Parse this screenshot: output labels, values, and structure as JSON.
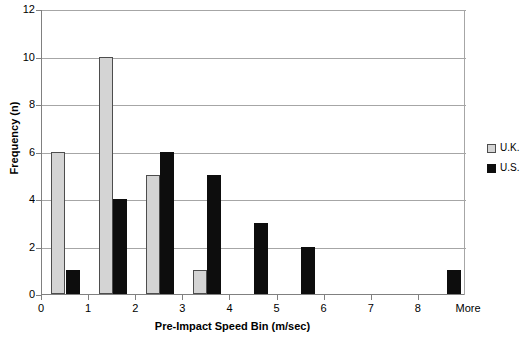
{
  "chart_data": {
    "type": "bar",
    "title": "",
    "xlabel": "Pre-Impact Speed Bin (m/sec)",
    "ylabel": "Frequency (n)",
    "ylim": [
      0,
      12
    ],
    "ytick_values": [
      0,
      2,
      4,
      6,
      8,
      10,
      12
    ],
    "ytick_labels": [
      "0",
      "2",
      "4",
      "6",
      "8",
      "10",
      "12"
    ],
    "xlim": [
      0,
      9
    ],
    "xtick_values": [
      0,
      1,
      2,
      3,
      4,
      5,
      6,
      7,
      8,
      9
    ],
    "xtick_labels": [
      "0",
      "1",
      "2",
      "3",
      "4",
      "5",
      "6",
      "7",
      "8",
      "More"
    ],
    "grid": true,
    "legend_position": "right",
    "legend": [
      "U.K.",
      "U.S."
    ],
    "colors": {
      "uk": "#d4d4d4",
      "uk_border": "#4d4d4d",
      "us": "#0d0d0d",
      "grid": "#a6a6a6",
      "axis": "#808080"
    },
    "series": [
      {
        "name": "U.K.",
        "color": "#d4d4d4",
        "points": [
          {
            "bin_center": 0.35,
            "value": 6
          },
          {
            "bin_center": 1.35,
            "value": 10
          },
          {
            "bin_center": 2.35,
            "value": 5
          },
          {
            "bin_center": 3.35,
            "value": 1
          }
        ]
      },
      {
        "name": "U.S.",
        "color": "#0d0d0d",
        "points": [
          {
            "bin_center": 0.65,
            "value": 1
          },
          {
            "bin_center": 1.65,
            "value": 4
          },
          {
            "bin_center": 2.65,
            "value": 6
          },
          {
            "bin_center": 3.65,
            "value": 5
          },
          {
            "bin_center": 4.65,
            "value": 3
          },
          {
            "bin_center": 5.65,
            "value": 2
          },
          {
            "bin_center": 8.75,
            "value": 1
          }
        ]
      }
    ]
  }
}
